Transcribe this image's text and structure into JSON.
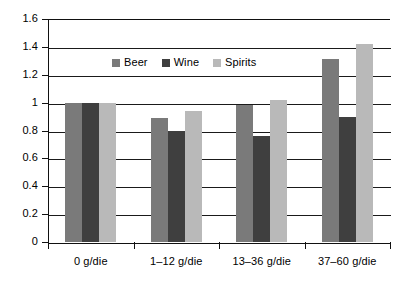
{
  "chart_data": {
    "type": "bar",
    "title": "",
    "subtitle": "",
    "xlabel": "",
    "ylabel": "",
    "ylim": [
      0,
      1.6
    ],
    "yticks": [
      "0",
      "0.2",
      "0.4",
      "0.6",
      "0.8",
      "1",
      "1.2",
      "1.4",
      "1.6"
    ],
    "ytick_values": [
      0,
      0.2,
      0.4,
      0.6,
      0.8,
      1,
      1.2,
      1.4,
      1.6
    ],
    "grid": true,
    "legend_position": "upper-center-left",
    "categories": [
      "0 g/die",
      "1–12 g/die",
      "13–36 g/die",
      "37–60 g/die"
    ],
    "series": [
      {
        "name": "Beer",
        "color": "#7a7a7a",
        "values": [
          1.0,
          0.89,
          0.98,
          1.31
        ]
      },
      {
        "name": "Wine",
        "color": "#3f3f3f",
        "values": [
          1.0,
          0.8,
          0.76,
          0.9
        ]
      },
      {
        "name": "Spirits",
        "color": "#b9b9b9",
        "values": [
          1.0,
          0.94,
          1.02,
          1.42
        ]
      }
    ]
  }
}
